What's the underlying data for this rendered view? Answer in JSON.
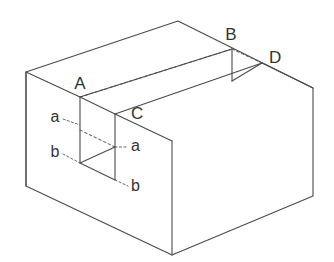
{
  "figure": {
    "canvas": {
      "width": 334,
      "height": 262
    },
    "background_color": "#ffffff",
    "line_color": "#4a4a4a",
    "hidden_line_color": "#6b6b6b",
    "label_color": "#333333"
  },
  "vertex_labels": {
    "a_point": "A",
    "b_point": "B",
    "c_point": "C",
    "d_point": "D"
  },
  "dimension_labels": {
    "a_left": "a",
    "a_right": "a",
    "b_left": "b",
    "b_right": "b"
  },
  "geometry": {
    "outer_block": {
      "left_top": [
        26,
        72
      ],
      "left_bottom": [
        26,
        186
      ],
      "back_apex": [
        178,
        21
      ],
      "right_top": [
        313,
        88
      ],
      "right_bottom": [
        313,
        196
      ],
      "front_bottom": [
        172,
        255
      ],
      "front_top": [
        172,
        141
      ]
    },
    "notch": {
      "A": [
        80,
        97
      ],
      "C": [
        115,
        114
      ],
      "B": [
        232,
        49
      ],
      "D": [
        262,
        63
      ],
      "A_bottom": [
        80,
        163
      ],
      "C_bottom": [
        115,
        180
      ],
      "B_bottom": [
        232,
        81
      ]
    }
  }
}
